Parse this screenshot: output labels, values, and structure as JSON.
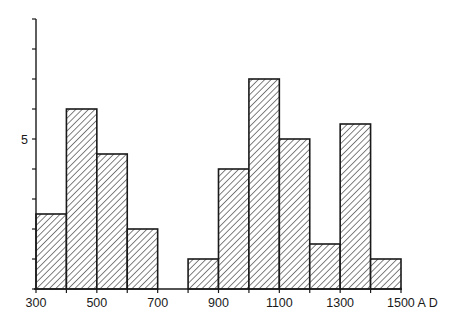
{
  "chart_data": {
    "type": "bar",
    "subtype": "histogram",
    "title": "",
    "xlabel": "A D",
    "ylabel": "",
    "bin_width": 100,
    "bins": [
      {
        "start": 300,
        "end": 400,
        "value": 2.5
      },
      {
        "start": 400,
        "end": 500,
        "value": 6
      },
      {
        "start": 500,
        "end": 600,
        "value": 4.5
      },
      {
        "start": 600,
        "end": 700,
        "value": 2
      },
      {
        "start": 700,
        "end": 800,
        "value": 0
      },
      {
        "start": 800,
        "end": 900,
        "value": 1
      },
      {
        "start": 900,
        "end": 1000,
        "value": 4
      },
      {
        "start": 1000,
        "end": 1100,
        "value": 7
      },
      {
        "start": 1100,
        "end": 1200,
        "value": 5
      },
      {
        "start": 1200,
        "end": 1300,
        "value": 1.5
      },
      {
        "start": 1300,
        "end": 1400,
        "value": 5.5
      },
      {
        "start": 1400,
        "end": 1500,
        "value": 1
      }
    ],
    "categories": [
      "300-400",
      "400-500",
      "500-600",
      "600-700",
      "700-800",
      "800-900",
      "900-1000",
      "1000-1100",
      "1100-1200",
      "1200-1300",
      "1300-1400",
      "1400-1500"
    ],
    "values": [
      2.5,
      6,
      4.5,
      2,
      0,
      1,
      4,
      7,
      5,
      1.5,
      5.5,
      1
    ],
    "x_tick_labels": [
      "300",
      "500",
      "700",
      "900",
      "1100",
      "1300",
      "1500 A D"
    ],
    "x_ticks": [
      300,
      400,
      500,
      600,
      700,
      800,
      900,
      1000,
      1100,
      1200,
      1300,
      1400,
      1500
    ],
    "y_tick_labels": [
      {
        "value": 5,
        "label": "5"
      }
    ],
    "y_ticks": [
      0,
      1,
      2,
      3,
      4,
      5,
      6,
      7,
      8,
      9
    ],
    "xlim": [
      300,
      1500
    ],
    "ylim": [
      0,
      9
    ],
    "grid": false,
    "legend": null,
    "fill": "diagonal-hatch",
    "colors": {
      "stroke": "#1a1a1a",
      "background": "#ffffff"
    }
  }
}
